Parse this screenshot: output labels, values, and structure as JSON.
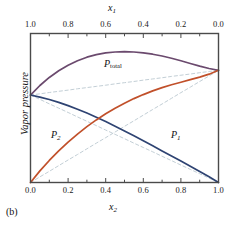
{
  "figure": {
    "caption": "(b)",
    "ylabel": "Vapor pressure",
    "top_axis_title_main": "x",
    "top_axis_title_sub": "1",
    "bottom_axis_title_main": "x",
    "bottom_axis_title_sub": "2"
  },
  "colors": {
    "p_total": "#6b4a6e",
    "p1": "#2e4372",
    "p2": "#c1502a",
    "ideal_dashed": "#c3cfd6",
    "frame": "#4a4a4a",
    "text": "#111111"
  },
  "labels": {
    "p_total_main": "P",
    "p_total_sub": "total",
    "p1_main": "P",
    "p1_sub": "1",
    "p2_main": "P",
    "p2_sub": "2"
  },
  "axes": {
    "top": {
      "name": "x1",
      "direction": "right-to-left",
      "tick_labels": [
        "1.0",
        "0.8",
        "0.6",
        "0.4",
        "0.2",
        "0.0"
      ],
      "tick_values": [
        1.0,
        0.8,
        0.6,
        0.4,
        0.2,
        0.0
      ],
      "minor_tick_step": 0.1
    },
    "bottom": {
      "name": "x2",
      "direction": "left-to-right",
      "tick_labels": [
        "0.0",
        "0.2",
        "0.4",
        "0.6",
        "0.8",
        "1.0"
      ],
      "tick_values": [
        0.0,
        0.2,
        0.4,
        0.6,
        0.8,
        1.0
      ],
      "minor_tick_step": 0.1
    },
    "y": {
      "name": "Vapor pressure",
      "tick_labels": [],
      "range": [
        0,
        1
      ]
    }
  },
  "chart_data": {
    "type": "line",
    "title": "",
    "subtitle": "",
    "xlabel": "x2",
    "ylabel": "Vapor pressure",
    "xlim": [
      0,
      1
    ],
    "ylim": [
      0,
      1
    ],
    "grid": false,
    "legend": "inline-curve-labels",
    "secondary_xaxis": {
      "label": "x1",
      "lim": [
        1,
        0
      ]
    },
    "annotations": [
      {
        "text": "P_total",
        "x": 0.44,
        "y": 0.8
      },
      {
        "text": "P_2",
        "x": 0.16,
        "y": 0.3
      },
      {
        "text": "P_1",
        "x": 0.76,
        "y": 0.3
      }
    ],
    "x": [
      0.0,
      0.05,
      0.1,
      0.15,
      0.2,
      0.25,
      0.3,
      0.35,
      0.4,
      0.45,
      0.5,
      0.55,
      0.6,
      0.65,
      0.7,
      0.75,
      0.8,
      0.85,
      0.9,
      0.95,
      1.0
    ],
    "series": [
      {
        "name": "P_total",
        "color": "#6b4a6e",
        "style": "solid",
        "values": [
          0.587,
          0.651,
          0.705,
          0.75,
          0.787,
          0.817,
          0.841,
          0.858,
          0.87,
          0.876,
          0.878,
          0.876,
          0.87,
          0.861,
          0.849,
          0.834,
          0.817,
          0.799,
          0.781,
          0.765,
          0.753
        ]
      },
      {
        "name": "P_1",
        "color": "#2e4372",
        "style": "solid",
        "values": [
          0.587,
          0.573,
          0.557,
          0.538,
          0.516,
          0.492,
          0.466,
          0.438,
          0.409,
          0.378,
          0.346,
          0.313,
          0.28,
          0.246,
          0.212,
          0.178,
          0.144,
          0.109,
          0.074,
          0.038,
          0.0
        ]
      },
      {
        "name": "P_2",
        "color": "#c1502a",
        "style": "solid",
        "values": [
          0.0,
          0.078,
          0.148,
          0.212,
          0.271,
          0.325,
          0.375,
          0.42,
          0.461,
          0.498,
          0.532,
          0.563,
          0.59,
          0.615,
          0.637,
          0.656,
          0.673,
          0.69,
          0.707,
          0.727,
          0.753
        ]
      },
      {
        "name": "P_1_ideal",
        "color": "#c3cfd6",
        "style": "dashed",
        "values": [
          0.587,
          0.558,
          0.528,
          0.499,
          0.47,
          0.44,
          0.411,
          0.382,
          0.352,
          0.323,
          0.294,
          0.264,
          0.235,
          0.206,
          0.176,
          0.147,
          0.117,
          0.088,
          0.059,
          0.029,
          0.0
        ]
      },
      {
        "name": "P_2_ideal",
        "color": "#c3cfd6",
        "style": "dashed",
        "values": [
          0.0,
          0.038,
          0.075,
          0.113,
          0.151,
          0.188,
          0.226,
          0.264,
          0.301,
          0.339,
          0.377,
          0.414,
          0.452,
          0.49,
          0.527,
          0.565,
          0.603,
          0.64,
          0.678,
          0.715,
          0.753
        ]
      },
      {
        "name": "P_total_ideal",
        "color": "#c3cfd6",
        "style": "dashed",
        "values": [
          0.587,
          0.595,
          0.604,
          0.612,
          0.62,
          0.629,
          0.637,
          0.645,
          0.653,
          0.662,
          0.67,
          0.678,
          0.687,
          0.695,
          0.703,
          0.712,
          0.72,
          0.728,
          0.737,
          0.745,
          0.753
        ]
      }
    ]
  }
}
